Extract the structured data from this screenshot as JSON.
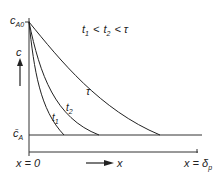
{
  "diagram": {
    "y_axis": {
      "label": "c",
      "top_label": "c",
      "top_label_sub": "A0",
      "bottom_label": "c̄",
      "bottom_label_sub": "A"
    },
    "x_axis": {
      "label": "x",
      "start_label": "x = 0",
      "end_label": "x = δ",
      "end_label_sub": "p"
    },
    "inequality": {
      "t1": "t",
      "t1_sub": "1",
      "lt1": "<",
      "t2": "t",
      "t2_sub": "2",
      "lt2": "<",
      "tau": "τ"
    },
    "curves": [
      {
        "label": "t",
        "sub": "1"
      },
      {
        "label": "t",
        "sub": "2"
      },
      {
        "label": "τ",
        "sub": ""
      }
    ],
    "colors": {
      "line": "#222222",
      "background": "#ffffff"
    }
  }
}
